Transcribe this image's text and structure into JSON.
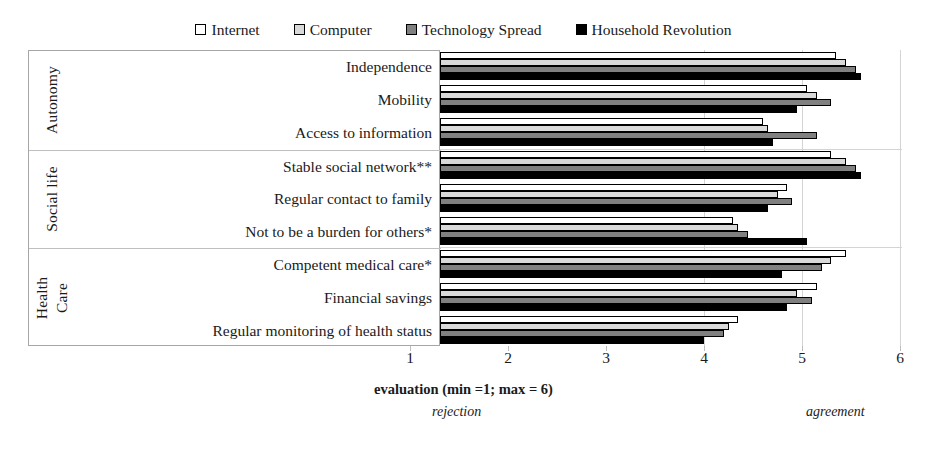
{
  "legend": {
    "position": "top-center",
    "items": [
      {
        "label": "Internet",
        "color": "#ffffff",
        "swatch": "series-swatch-internet"
      },
      {
        "label": "Computer",
        "color": "#d9d9d9",
        "swatch": "series-swatch-computer"
      },
      {
        "label": "Technology Spread",
        "color": "#808080",
        "swatch": "series-swatch-technology-spread"
      },
      {
        "label": "Household Revolution",
        "color": "#000000",
        "swatch": "series-swatch-household-revolution"
      }
    ]
  },
  "axis": {
    "ticks": [
      "1",
      "2",
      "3",
      "4",
      "5",
      "6"
    ],
    "xlabel": "evaluation (min =1; max = 6)",
    "low_anchor": "rejection",
    "high_anchor": "agreement"
  },
  "groups": [
    {
      "title": "Autonomy",
      "title_lines": [
        "Autonomy"
      ]
    },
    {
      "title": "Social life",
      "title_lines": [
        "Social life"
      ]
    },
    {
      "title": "Health Care",
      "title_lines": [
        "Health",
        "Care"
      ]
    }
  ],
  "chart_data": {
    "type": "bar",
    "orientation": "horizontal",
    "title": "",
    "xlabel": "evaluation (min =1; max = 6)",
    "ylabel": "",
    "xlim": [
      1,
      6
    ],
    "clip_min": 3.5,
    "grid": true,
    "legend_position": "top-center",
    "annotations": [
      "rejection",
      "agreement"
    ],
    "group_names": [
      "Autonomy",
      "Social life",
      "Health Care"
    ],
    "categories": [
      "Independence",
      "Mobility",
      "Access to information",
      "Stable social network**",
      "Regular contact to family",
      "Not to be a burden for others*",
      "Competent medical care*",
      "Financial savings",
      "Regular monitoring of health status"
    ],
    "category_groups": [
      "Autonomy",
      "Autonomy",
      "Autonomy",
      "Social life",
      "Social life",
      "Social life",
      "Health Care",
      "Health Care",
      "Health Care"
    ],
    "series": [
      {
        "name": "Internet",
        "color": "#ffffff",
        "values": [
          5.35,
          5.05,
          4.6,
          5.3,
          4.85,
          4.3,
          5.45,
          5.15,
          4.35
        ]
      },
      {
        "name": "Computer",
        "color": "#d9d9d9",
        "values": [
          5.45,
          5.15,
          4.65,
          5.45,
          4.75,
          4.35,
          5.3,
          4.95,
          4.25
        ]
      },
      {
        "name": "Technology Spread",
        "color": "#808080",
        "values": [
          5.55,
          5.3,
          5.15,
          5.55,
          4.9,
          4.45,
          5.2,
          5.1,
          4.2
        ]
      },
      {
        "name": "Household Revolution",
        "color": "#000000",
        "values": [
          5.6,
          4.95,
          4.7,
          5.6,
          4.65,
          5.05,
          4.8,
          4.85,
          4.0
        ]
      }
    ]
  }
}
